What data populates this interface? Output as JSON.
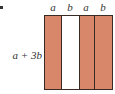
{
  "figure": {
    "marker": ".",
    "side_label": "a + 3b",
    "strips": [
      {
        "label": "a",
        "color": "#d9876a",
        "width": 16
      },
      {
        "label": "b",
        "color": "#ffffff",
        "width": 18
      },
      {
        "label": "a",
        "color": "#d9876a",
        "width": 15
      },
      {
        "label": "b",
        "color": "#d9876a",
        "width": 18
      }
    ]
  }
}
